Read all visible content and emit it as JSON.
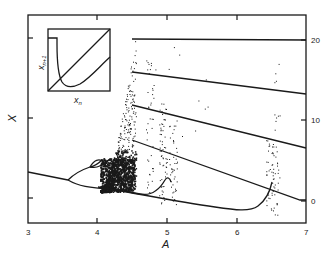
{
  "chart_data": {
    "type": "scatter",
    "title": "",
    "xlabel": "A",
    "ylabel": "X",
    "xlim": [
      3,
      7
    ],
    "x_ticks": [
      "3",
      "4",
      "5",
      "6",
      "7"
    ],
    "right_y_ticks": [
      "20",
      "10",
      "0"
    ],
    "right_ylim": [
      0,
      20
    ],
    "grid": false,
    "legend": null,
    "series": [
      {
        "name": "fixed-point-branch",
        "x": [
          3.0,
          3.55
        ],
        "y_px": [
          172,
          180
        ]
      },
      {
        "name": "period-2-upper",
        "x": [
          3.55,
          3.95
        ],
        "y_px": [
          180,
          167
        ]
      },
      {
        "name": "period-2-lower",
        "x": [
          3.55,
          4.1
        ],
        "y_px": [
          180,
          187
        ]
      },
      {
        "name": "window-line-1",
        "x": [
          4.5,
          7.0
        ],
        "y_right_axis": [
          20.1,
          19.9
        ]
      },
      {
        "name": "window-line-2",
        "x": [
          4.5,
          7.0
        ],
        "y_right_axis": [
          16.0,
          13.4
        ]
      },
      {
        "name": "window-line-3",
        "x": [
          4.5,
          7.0
        ],
        "y_right_axis": [
          12.0,
          6.6
        ]
      },
      {
        "name": "window-line-4",
        "x": [
          4.5,
          6.95
        ],
        "y_right_axis": [
          7.5,
          0.1
        ]
      },
      {
        "name": "lower-loop",
        "x": [
          4.3,
          6.2,
          6.5
        ],
        "y_px": [
          190,
          209,
          188
        ]
      }
    ],
    "inset": {
      "xlabel": "x_n",
      "ylabel": "x_{n+1}",
      "description": "Return map with diagonal identity line, sharply dropping curve from a plateau, and parallel rising branch"
    }
  },
  "labels": {
    "x_axis": "A",
    "y_axis": "X",
    "inset_x": "x",
    "inset_x_sub": "n",
    "inset_y": "x",
    "inset_y_sub": "n+1"
  },
  "ticks": {
    "x": [
      {
        "label": "3",
        "px": 28
      },
      {
        "label": "4",
        "px": 97
      },
      {
        "label": "5",
        "px": 167
      },
      {
        "label": "6",
        "px": 237
      },
      {
        "label": "7",
        "px": 306
      }
    ],
    "right_y": [
      {
        "label": "20",
        "py": 40
      },
      {
        "label": "10",
        "py": 120
      },
      {
        "label": "0",
        "py": 201
      }
    ],
    "left_y_px": [
      38,
      118,
      198
    ]
  },
  "colors": {
    "ink": "#1a1a1a",
    "background": "#ffffff"
  }
}
